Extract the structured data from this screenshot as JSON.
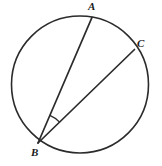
{
  "figure": {
    "background_color": "#ffffff",
    "stroke_color": "#2b2b2b",
    "labels": {
      "a": "A",
      "b": "B",
      "c": "C"
    },
    "circle": {
      "center_x": 80,
      "center_y": 84.5,
      "radius": 68.5,
      "stroke_width": 1.6
    },
    "points": {
      "A": {
        "x": 92,
        "y": 17.4
      },
      "B": {
        "x": 38,
        "y": 143
      },
      "C": {
        "x": 134.5,
        "y": 49.5
      }
    },
    "chords": [
      {
        "name": "chord-BA",
        "from": "B",
        "to": "A"
      },
      {
        "name": "chord-BC",
        "from": "B",
        "to": "C"
      }
    ],
    "angle_mark": {
      "vertex": "B",
      "radius": 30,
      "between": [
        "BA",
        "BC"
      ]
    }
  }
}
